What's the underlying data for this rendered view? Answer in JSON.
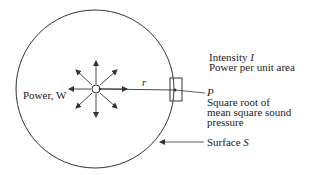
{
  "diagram": {
    "source_label": "Power, W",
    "radius_label": "r",
    "intensity_label": "Intensity",
    "intensity_symbol": "I",
    "intensity_desc": "Power per unit area",
    "pressure_symbol": "P",
    "pressure_desc_line1": "Square root of",
    "pressure_desc_line2": "mean square sound",
    "pressure_desc_line3": "pressure",
    "surface_label": "Surface",
    "surface_symbol": "S",
    "colors": {
      "line": "#333333",
      "text": "#222222",
      "background": "#ffffff"
    }
  }
}
